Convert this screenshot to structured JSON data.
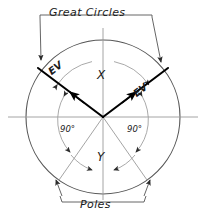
{
  "figure": {
    "title": "Great Circles",
    "bottom_label": "Poles",
    "axis_labels": {
      "x": "X",
      "y": "Y"
    },
    "edge_view_left": "EV",
    "edge_view_right": "EV",
    "angles": {
      "left": "90°",
      "right": "90°"
    },
    "colors": {
      "ink": "#1a1a1a",
      "heavy_line": "#000000",
      "thin_line": "#8a8a8a",
      "background": "#ffffff"
    }
  },
  "geometry": {
    "center": {
      "x": 103,
      "y": 117
    },
    "radius": 77,
    "inner_arc_radius": 56,
    "great_circle_left_angle_deg": 215,
    "great_circle_right_angle_deg": 325,
    "pole_left_angle_deg": 125,
    "pole_right_angle_deg": 55
  }
}
